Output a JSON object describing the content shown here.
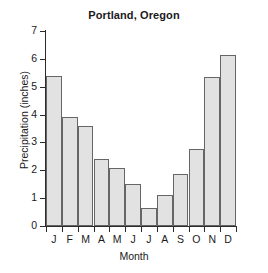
{
  "chart_data": {
    "type": "bar",
    "title": "Portland, Oregon",
    "xlabel": "Month",
    "ylabel": "Precipitation (inches)",
    "categories": [
      "J",
      "F",
      "M",
      "A",
      "M",
      "J",
      "J",
      "A",
      "S",
      "O",
      "N",
      "D"
    ],
    "category_names": [
      "January",
      "February",
      "March",
      "April",
      "May",
      "June",
      "July",
      "August",
      "September",
      "October",
      "November",
      "December"
    ],
    "values": [
      5.4,
      3.9,
      3.6,
      2.4,
      2.1,
      1.5,
      0.65,
      1.1,
      1.85,
      2.75,
      5.35,
      6.15
    ],
    "ylim": [
      0,
      7
    ],
    "ytick_labels": [
      "7",
      "6",
      "5",
      "4",
      "3",
      "2",
      "1",
      "0"
    ],
    "ytick_values": [
      7,
      6,
      5,
      4,
      3,
      2,
      1,
      0
    ],
    "grid": false,
    "legend": false,
    "bar_fill_color": "#e2e2e2",
    "bar_edge_color": "#666666",
    "axis_color": "#2b2b2b",
    "background_color": "#ffffff"
  }
}
